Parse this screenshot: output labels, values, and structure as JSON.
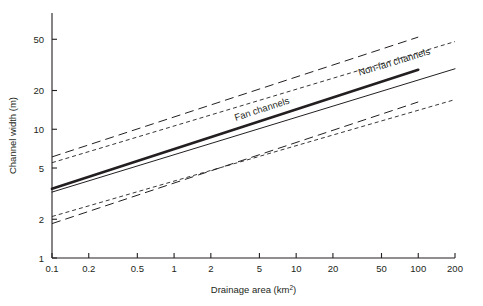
{
  "figure": {
    "name": "channel-width-vs-drainage-area",
    "background": "#ffffff",
    "ink_color": "#231f20"
  },
  "chart_data": {
    "type": "line",
    "title": "",
    "subtitle": "",
    "xlabel_text": "Drainage area (km",
    "xlabel_sup": "2",
    "xlabel_tail": ")",
    "xlabel": "Drainage area (km2)",
    "ylabel": "Channel width (m)",
    "xscale": "log",
    "yscale": "log",
    "xlim": [
      0.1,
      200
    ],
    "ylim": [
      1,
      80
    ],
    "grid": false,
    "legend_position": "inline-on-line",
    "xticks": [
      0.1,
      0.2,
      0.5,
      1,
      2,
      5,
      10,
      20,
      50,
      100,
      200
    ],
    "xtick_labels": [
      "0.1",
      "0.2",
      "0.5",
      "1",
      "2",
      "5",
      "10",
      "20",
      "50",
      "100",
      "200"
    ],
    "yticks": [
      1,
      2,
      5,
      10,
      20,
      50
    ],
    "ytick_labels": [
      "1",
      "2",
      "5",
      "10",
      "20",
      "50"
    ],
    "series": [
      {
        "name": "Fan channels",
        "label": "Fan channels",
        "style": "solid",
        "linewidth": 2.6,
        "color": "#231f20",
        "x": [
          0.1,
          100
        ],
        "y": [
          3.45,
          29.0
        ],
        "label_anchor_x": 3.2,
        "label_anchor_y": 11.6
      },
      {
        "name": "Non-fan channels",
        "label": "Non-fan channels",
        "style": "solid",
        "linewidth": 1.0,
        "color": "#231f20",
        "x": [
          0.1,
          200
        ],
        "y": [
          3.25,
          29.5
        ],
        "label_anchor_x": 33.0,
        "label_anchor_y": 26.0
      },
      {
        "name": "Fan channels upper confidence limit",
        "label": "",
        "style": "dashed",
        "linewidth": 1.0,
        "color": "#231f20",
        "x": [
          0.1,
          100
        ],
        "y": [
          6.1,
          52.0
        ]
      },
      {
        "name": "Fan channels lower confidence limit",
        "label": "",
        "style": "dashed",
        "linewidth": 1.0,
        "color": "#231f20",
        "x": [
          0.1,
          100
        ],
        "y": [
          1.85,
          16.3
        ]
      },
      {
        "name": "Non-fan channels upper confidence limit",
        "label": "",
        "style": "dotted",
        "linewidth": 0.9,
        "color": "#231f20",
        "x": [
          0.1,
          200
        ],
        "y": [
          5.5,
          48.0
        ]
      },
      {
        "name": "Non-fan channels lower confidence limit",
        "label": "",
        "style": "dotted",
        "linewidth": 0.9,
        "color": "#231f20",
        "x": [
          0.1,
          200
        ],
        "y": [
          2.1,
          17.0
        ]
      }
    ]
  }
}
